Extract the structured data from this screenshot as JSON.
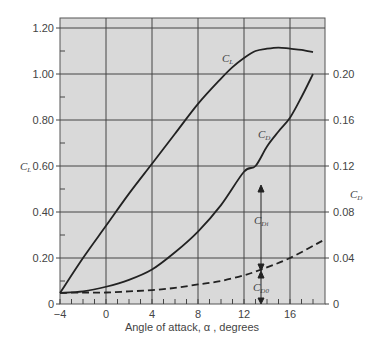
{
  "chart_data": {
    "type": "line",
    "title": "",
    "xlabel": "Angle of attack, α , degrees",
    "ylabel_left": "C_L",
    "ylabel_right": "C_D",
    "xlim": [
      -4,
      19
    ],
    "ylim_left": [
      0,
      1.24
    ],
    "ylim_right": [
      0,
      0.248
    ],
    "x_ticks": [
      -4,
      0,
      4,
      8,
      12,
      16
    ],
    "x_tick_labels": [
      "−4",
      "0",
      "4",
      "8",
      "12",
      "16"
    ],
    "y_left_ticks": [
      0,
      0.2,
      0.4,
      0.6,
      0.8,
      1.0,
      1.2
    ],
    "y_left_tick_labels": [
      "0",
      "0.20",
      "0.40",
      "0.60",
      "0.80",
      "1.00",
      "1.20"
    ],
    "y_right_ticks": [
      0,
      0.04,
      0.08,
      0.12,
      0.16,
      0.2
    ],
    "y_right_tick_labels": [
      "0",
      "0.04",
      "0.08",
      "0.12",
      "0.16",
      "0.20"
    ],
    "grid": true,
    "background": "#d9d9d9",
    "series": [
      {
        "name": "C_L",
        "axis": "left",
        "style": "solid",
        "x": [
          -4,
          -2,
          0,
          2,
          4,
          6,
          8,
          10,
          11,
          12,
          13,
          14,
          15,
          16,
          17,
          18
        ],
        "values": [
          0.048,
          0.2,
          0.34,
          0.48,
          0.61,
          0.74,
          0.87,
          0.98,
          1.03,
          1.07,
          1.1,
          1.11,
          1.115,
          1.11,
          1.105,
          1.095
        ]
      },
      {
        "name": "C_D",
        "axis": "right",
        "style": "solid",
        "x": [
          -4,
          -2,
          0,
          2,
          4,
          6,
          8,
          10,
          12,
          13,
          14,
          15,
          16,
          17,
          18
        ],
        "values": [
          0.0096,
          0.011,
          0.015,
          0.021,
          0.03,
          0.045,
          0.063,
          0.086,
          0.115,
          0.12,
          0.137,
          0.15,
          0.162,
          0.18,
          0.2
        ]
      },
      {
        "name": "C_D0",
        "axis": "right",
        "style": "dashed",
        "x": [
          -4,
          -2,
          0,
          2,
          4,
          6,
          8,
          10,
          12,
          13.5,
          16,
          19
        ],
        "values": [
          0.0096,
          0.01,
          0.01,
          0.011,
          0.012,
          0.014,
          0.017,
          0.02,
          0.025,
          0.03,
          0.04,
          0.056
        ]
      }
    ],
    "annotations": [
      {
        "text": "C_L",
        "x": 10.5,
        "y_left": 1.08
      },
      {
        "text": "C_D",
        "x": 13.6,
        "y_right": 0.144
      },
      {
        "text": "C_Di",
        "x": 13.6,
        "y_right": 0.078,
        "note": "induced drag arrow between C_D and C_D0 at α≈13.5"
      },
      {
        "text": "C_D0",
        "x": 13.6,
        "y_right": 0.014,
        "note": "profile drag arrow from 0 to C_D0 at α≈13.5"
      }
    ]
  },
  "labels": {
    "cl_axis": "C",
    "cl_axis_sub": "L",
    "cd_axis": "C",
    "cd_axis_sub": "D",
    "x_title": "Angle of attack, α , degrees",
    "curve_cl": "C",
    "curve_cl_sub": "L",
    "curve_cd": "C",
    "curve_cd_sub": "D",
    "curve_cdi": "C",
    "curve_cdi_sub": "Di",
    "curve_cd0": "C",
    "curve_cd0_sub": "D0"
  }
}
